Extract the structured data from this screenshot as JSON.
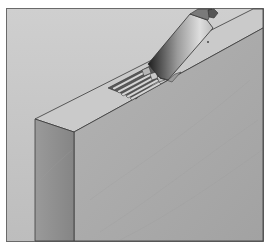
{
  "figure": {
    "colors": {
      "background": "#c4c4c4",
      "frame_border": "#6a6a6a",
      "door_top_edge": "#c9c9c9",
      "door_front_face": "#a9a9a9",
      "door_left_face": "#8e8e8e",
      "outline": "#3a3a3a",
      "chisel_light": "#d8d8d8",
      "chisel_dark": "#2e2e2e",
      "mortise_slot": "#4a4a4a",
      "mortise_rib": "#d2d2d2"
    },
    "mortise_ribs": 5
  }
}
